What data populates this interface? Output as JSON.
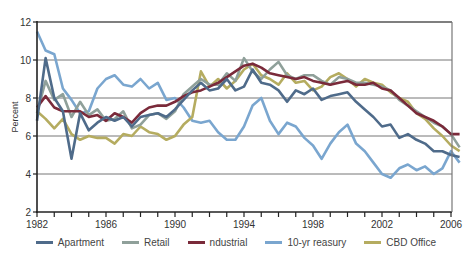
{
  "chart_data": {
    "type": "line",
    "title": "",
    "xlabel": "",
    "ylabel": "Percent",
    "ylim": [
      2,
      12
    ],
    "xlim": [
      1982,
      2006.5
    ],
    "grid": true,
    "legend_position": "bottom",
    "yticks": [
      "2",
      "4",
      "6",
      "8",
      "10",
      "12"
    ],
    "xtick_labels": [
      "1982",
      "1986",
      "1990",
      "1994",
      "1998",
      "2002",
      "2006"
    ],
    "x": [
      1982,
      1982.5,
      1983,
      1983.5,
      1984,
      1984.5,
      1985,
      1985.5,
      1986,
      1986.5,
      1987,
      1987.5,
      1988,
      1988.5,
      1989,
      1989.5,
      1990,
      1990.5,
      1991,
      1991.5,
      1992,
      1992.5,
      1993,
      1993.5,
      1994,
      1994.5,
      1995,
      1995.5,
      1996,
      1996.5,
      1997,
      1997.5,
      1998,
      1998.5,
      1999,
      1999.5,
      2000,
      2000.5,
      2001,
      2001.5,
      2002,
      2002.5,
      2003,
      2003.5,
      2004,
      2004.5,
      2005,
      2005.5,
      2006,
      2006.5
    ],
    "series": [
      {
        "name": "Apartment",
        "color": "#4f6b8a",
        "values": [
          6.8,
          10.1,
          8.0,
          7.3,
          4.8,
          7.2,
          6.3,
          6.7,
          7.0,
          6.8,
          7.0,
          6.5,
          7.0,
          7.1,
          7.2,
          7.0,
          7.4,
          7.9,
          8.4,
          8.8,
          8.4,
          8.5,
          9.0,
          8.4,
          8.6,
          9.5,
          8.8,
          8.7,
          8.4,
          7.8,
          8.4,
          8.2,
          8.5,
          7.9,
          8.1,
          8.2,
          8.3,
          7.8,
          7.4,
          7.0,
          6.5,
          6.6,
          5.9,
          6.1,
          5.8,
          5.6,
          5.2,
          5.2,
          5.0,
          4.9
        ]
      },
      {
        "name": "Retail",
        "color": "#8fa09a",
        "values": [
          7.2,
          8.9,
          7.9,
          8.2,
          7.0,
          7.8,
          7.1,
          7.4,
          6.8,
          6.9,
          7.3,
          6.4,
          6.6,
          7.1,
          7.2,
          6.9,
          7.3,
          8.2,
          8.6,
          9.0,
          8.7,
          8.7,
          9.3,
          8.9,
          10.1,
          9.4,
          9.0,
          9.5,
          9.9,
          9.2,
          9.0,
          9.2,
          9.2,
          8.9,
          8.7,
          9.1,
          9.0,
          8.8,
          8.8,
          8.7,
          8.6,
          8.4,
          7.9,
          7.6,
          7.3,
          7.0,
          6.7,
          6.5,
          6.1,
          5.4
        ]
      },
      {
        "name": "ndustrial",
        "color": "#7a2a3a",
        "values": [
          7.5,
          8.1,
          7.5,
          7.3,
          7.3,
          7.3,
          7.0,
          7.1,
          6.8,
          7.2,
          7.0,
          6.7,
          7.2,
          7.5,
          7.6,
          7.6,
          7.8,
          8.1,
          8.3,
          8.4,
          8.6,
          8.8,
          9.1,
          9.4,
          9.7,
          9.8,
          9.6,
          9.3,
          9.2,
          9.1,
          9.0,
          9.1,
          8.9,
          8.8,
          8.7,
          8.8,
          8.9,
          8.7,
          8.7,
          8.8,
          8.5,
          8.4,
          8.0,
          7.6,
          7.2,
          7.0,
          6.8,
          6.5,
          6.1,
          6.1
        ]
      },
      {
        "name": "10-yr  reasury",
        "color": "#7aa6cf",
        "values": [
          11.5,
          10.5,
          10.3,
          8.5,
          7.9,
          7.2,
          7.3,
          8.5,
          9.0,
          9.2,
          8.7,
          8.6,
          9.0,
          8.5,
          8.8,
          7.9,
          8.0,
          7.5,
          6.8,
          6.7,
          6.8,
          6.2,
          5.8,
          5.8,
          6.5,
          7.6,
          8.0,
          6.8,
          6.1,
          6.7,
          6.5,
          5.9,
          5.5,
          4.8,
          5.6,
          6.2,
          6.6,
          5.6,
          5.2,
          4.6,
          4.0,
          3.8,
          4.3,
          4.5,
          4.2,
          4.4,
          4.0,
          4.3,
          5.2,
          4.6
        ]
      },
      {
        "name": "CBD Office",
        "color": "#b5ac60",
        "values": [
          7.3,
          6.9,
          6.4,
          6.9,
          6.1,
          5.8,
          6.0,
          5.9,
          5.9,
          5.6,
          6.1,
          6.0,
          6.5,
          6.2,
          6.1,
          5.8,
          6.0,
          6.6,
          7.0,
          9.4,
          8.6,
          9.0,
          8.5,
          8.9,
          9.5,
          9.8,
          9.2,
          9.0,
          8.7,
          9.3,
          8.8,
          8.9,
          8.4,
          8.6,
          9.1,
          9.3,
          9.0,
          8.6,
          9.0,
          8.8,
          8.7,
          8.3,
          8.0,
          7.8,
          7.2,
          6.9,
          6.4,
          6.0,
          5.5,
          5.2
        ]
      }
    ]
  },
  "legend": {
    "items": [
      {
        "label": "Apartment",
        "color": "#4f6b8a"
      },
      {
        "label": "Retail",
        "color": "#8fa09a"
      },
      {
        "label": "ndustrial",
        "color": "#7a2a3a"
      },
      {
        "label": "10-yr  reasury",
        "color": "#7aa6cf"
      },
      {
        "label": "CBD Office",
        "color": "#b5ac60"
      }
    ]
  },
  "axis": {
    "y_title": "Percent"
  }
}
